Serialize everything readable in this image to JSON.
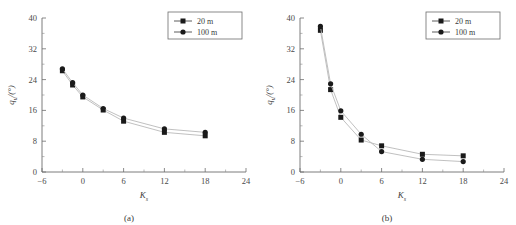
{
  "figure": {
    "panels": [
      {
        "caption": "(a)",
        "legend": {
          "entries": [
            {
              "label": "20 m",
              "marker": "square-marker",
              "color": "#1a1a1a"
            },
            {
              "label": "100 m",
              "marker": "circle-marker",
              "color": "#1a1a1a"
            }
          ]
        },
        "chart_data": {
          "type": "line",
          "title": "",
          "xlabel": "K",
          "xlabel_sub": "s",
          "ylabel": "q",
          "ylabel_sub": "u",
          "ylabel_unit": "/(°)",
          "xlim": [
            -6,
            24
          ],
          "ylim": [
            0,
            40
          ],
          "xticks": [
            -6,
            0,
            6,
            12,
            18,
            24
          ],
          "yticks": [
            0,
            8,
            16,
            24,
            32,
            40
          ],
          "grid": false,
          "legend_position": "top-right",
          "x": [
            -3,
            -1.5,
            0,
            3,
            6,
            12,
            18
          ],
          "series": [
            {
              "name": "20 m",
              "marker": "square",
              "values": [
                26.3,
                22.6,
                19.5,
                16.1,
                13.2,
                10.3,
                9.4
              ]
            },
            {
              "name": "100 m",
              "marker": "circle",
              "values": [
                26.8,
                23.2,
                20.0,
                16.5,
                14.0,
                11.2,
                10.3
              ]
            }
          ]
        }
      },
      {
        "caption": "(b)",
        "legend": {
          "entries": [
            {
              "label": "20 m",
              "marker": "square-marker",
              "color": "#1a1a1a"
            },
            {
              "label": "100 m",
              "marker": "circle-marker",
              "color": "#1a1a1a"
            }
          ]
        },
        "chart_data": {
          "type": "line",
          "title": "",
          "xlabel": "K",
          "xlabel_sub": "s",
          "ylabel": "q",
          "ylabel_sub": "u",
          "ylabel_unit": "/(°)",
          "xlim": [
            -6,
            24
          ],
          "ylim": [
            0,
            40
          ],
          "xticks": [
            -6,
            0,
            6,
            12,
            18,
            24
          ],
          "yticks": [
            0,
            8,
            16,
            24,
            32,
            40
          ],
          "grid": false,
          "legend_position": "top-right",
          "x": [
            -3,
            -1.5,
            0,
            3,
            6,
            12,
            18
          ],
          "series": [
            {
              "name": "20 m",
              "marker": "square",
              "values": [
                36.8,
                21.4,
                14.2,
                8.3,
                6.8,
                4.6,
                4.2
              ]
            },
            {
              "name": "100 m",
              "marker": "circle",
              "values": [
                37.8,
                22.9,
                15.9,
                9.8,
                5.3,
                3.3,
                2.7
              ]
            }
          ]
        }
      }
    ]
  }
}
